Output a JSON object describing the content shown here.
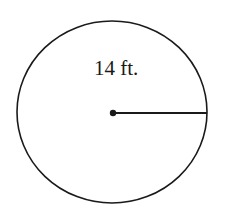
{
  "diagram": {
    "shape": "circle",
    "radius_label": "14 ft.",
    "center_point": "dot",
    "radius_segment": "center-to-right-edge",
    "stroke_color": "#1a1a1a",
    "background": "#ffffff"
  }
}
